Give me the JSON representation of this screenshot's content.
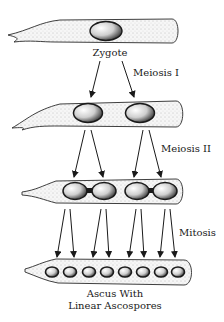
{
  "diagram": {
    "stages": [
      {
        "id": "zygote",
        "label": "Zygote",
        "nuclei": 1
      },
      {
        "id": "after-meiosis-1",
        "label": "",
        "nuclei": 2
      },
      {
        "id": "after-meiosis-2",
        "label": "",
        "nuclei": 4
      },
      {
        "id": "ascus",
        "label_line1": "Ascus With",
        "label_line2": "Linear Ascospores",
        "nuclei": 8
      }
    ],
    "transitions": [
      {
        "label": "Meiosis I",
        "arrows": 2
      },
      {
        "label": "Meiosis II",
        "arrows": 4
      },
      {
        "label": "Mitosis",
        "arrows": 8
      }
    ],
    "colors": {
      "ink": "#1a1a1a",
      "cell_fill": "#f4f4f4",
      "stipple": "#9a9a9a",
      "nucleus_fill": "#e6e6e6"
    }
  }
}
